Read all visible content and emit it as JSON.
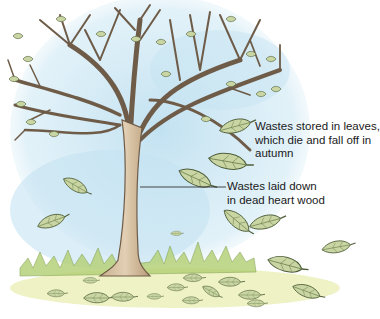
{
  "diagram": {
    "labels": [
      {
        "id": "leaves",
        "lines": [
          "Wastes stored in leaves,",
          "which die and fall off in",
          "autumn"
        ]
      },
      {
        "id": "heartwood",
        "lines": [
          "Wastes laid down",
          "in dead heart wood"
        ]
      }
    ],
    "colors": {
      "sky": "#bfe0f0",
      "trunk": "#d9c3a5",
      "trunk_shade": "#a88d6c",
      "branch_outline": "#6e5c48",
      "leaf": "#c9d6a3",
      "leaf_dark": "#8ea36a",
      "leaf_outline": "#4f5e3a",
      "grass": "#b6d27a",
      "ground": "#eef2c4",
      "pointer_line": "#333333"
    }
  }
}
